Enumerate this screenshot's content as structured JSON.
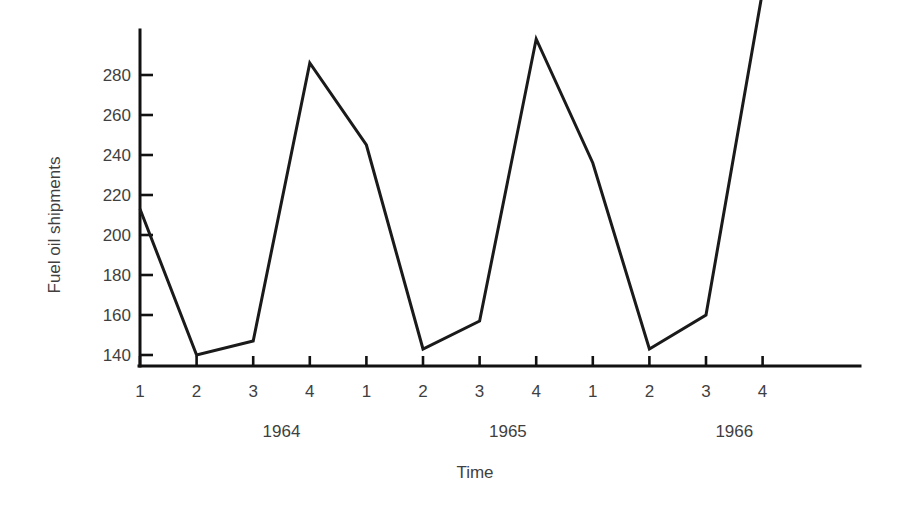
{
  "chart_data": {
    "type": "line",
    "title": "",
    "xlabel": "Time",
    "ylabel": "Fuel oil shipments",
    "x": [
      "1964 Q1",
      "1964 Q2",
      "1964 Q3",
      "1964 Q4",
      "1965 Q1",
      "1965 Q2",
      "1965 Q3",
      "1965 Q4",
      "1966 Q1",
      "1966 Q2",
      "1966 Q3",
      "1966 Q4"
    ],
    "categories": [
      "1",
      "2",
      "3",
      "4",
      "1",
      "2",
      "3",
      "4",
      "1",
      "2",
      "3",
      "4"
    ],
    "values": [
      213,
      140,
      147,
      286,
      245,
      143,
      157,
      298,
      236,
      143,
      160,
      322
    ],
    "ylim": [
      132,
      312
    ],
    "xlim": [
      0.6,
      12.6
    ],
    "yticks": [
      140,
      160,
      180,
      200,
      220,
      240,
      260,
      280
    ],
    "ytick_labels": [
      "140",
      "160",
      "180",
      "200",
      "220",
      "240",
      "260",
      "280"
    ],
    "xticks": [
      1,
      2,
      3,
      4,
      5,
      6,
      7,
      8,
      9,
      10,
      11,
      12
    ],
    "xtick_labels": [
      "1",
      "2",
      "3",
      "4",
      "1",
      "2",
      "3",
      "4",
      "1",
      "2",
      "3",
      "4"
    ],
    "group_labels": [
      {
        "label": "1964",
        "center_index": 2.5
      },
      {
        "label": "1965",
        "center_index": 6.5
      },
      {
        "label": "1966",
        "center_index": 10.5
      }
    ],
    "grid": false,
    "legend": "none",
    "line_color": "#1a1a1a",
    "axis_color": "#111111",
    "background_color": "#ffffff",
    "series": [
      {
        "name": "Fuel oil shipments",
        "values": [
          213,
          140,
          147,
          286,
          245,
          143,
          157,
          298,
          236,
          143,
          160,
          322
        ]
      }
    ]
  }
}
